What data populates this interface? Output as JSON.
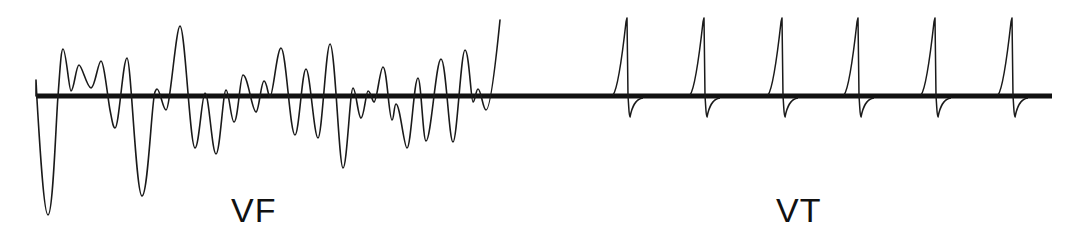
{
  "figure": {
    "baseline": {
      "x1": 36,
      "x2": 1052,
      "y": 96,
      "stroke": "#111111",
      "width": 5
    },
    "trace_color": "#1a1a1a",
    "panels": [
      {
        "id": "vf",
        "label": "VF",
        "description": "ventricular fibrillation - chaotic irregular waveform",
        "path": "M36,96 L36,80 L37,100 C40,150 44,215 48,215 C53,215 56,120 58,96 C60,70 61,49 63,49 C66,49 69,91 71,91 C74,91 76,65 79,65 C82,65 87,88 91,88 C95,88 98,61 101,61 C104,61 108,100 110,110 C112,120 113,128 115,128 C119,128 123,58 127,58 C131,58 136,196 142,196 C148,196 152,96 155,92 C156,90 156,89 157,89 C160,89 163,110 166,110 C170,110 176,26 180,26 C185,26 190,148 195,148 C199,148 202,93 205,93 C209,93 212,154 216,154 C220,154 223,90 226,90 C229,90 231,122 234,122 C238,122 240,75 243,75 C248,75 252,112 256,112 C259,112 261,81 264,81 C267,81 268,97 270,97 C273,97 277,48 281,48 C286,48 290,135 295,135 C299,135 302,69 306,69 C310,69 314,138 318,138 C322,138 326,44 330,44 C335,44 339,168 343,168 C347,168 350,88 353,88 C356,88 358,118 361,118 C364,118 366,91 368,91 C371,91 372,102 374,102 C377,102 380,67 383,67 C387,67 389,120 392,120 C394,120 394,104 396,104 C400,104 404,148 407,148 C411,148 414,78 418,78 C421,78 423,141 426,141 C431,141 436,59 441,59 C446,59 449,142 453,142 C457,142 461,50 465,50 C469,50 471,102 473,102 C475,102 476,89 478,89 C481,89 483,110 486,110 C490,110 495,70 500,20"
      },
      {
        "id": "vt",
        "label": "VT",
        "description": "ventricular tachycardia - regular monomorphic complexes",
        "complex_count": 6,
        "complex_x": [
          613,
          690,
          768,
          844,
          921,
          998
        ],
        "spike_top_y": 18,
        "dip_bottom_y": 117
      }
    ]
  }
}
